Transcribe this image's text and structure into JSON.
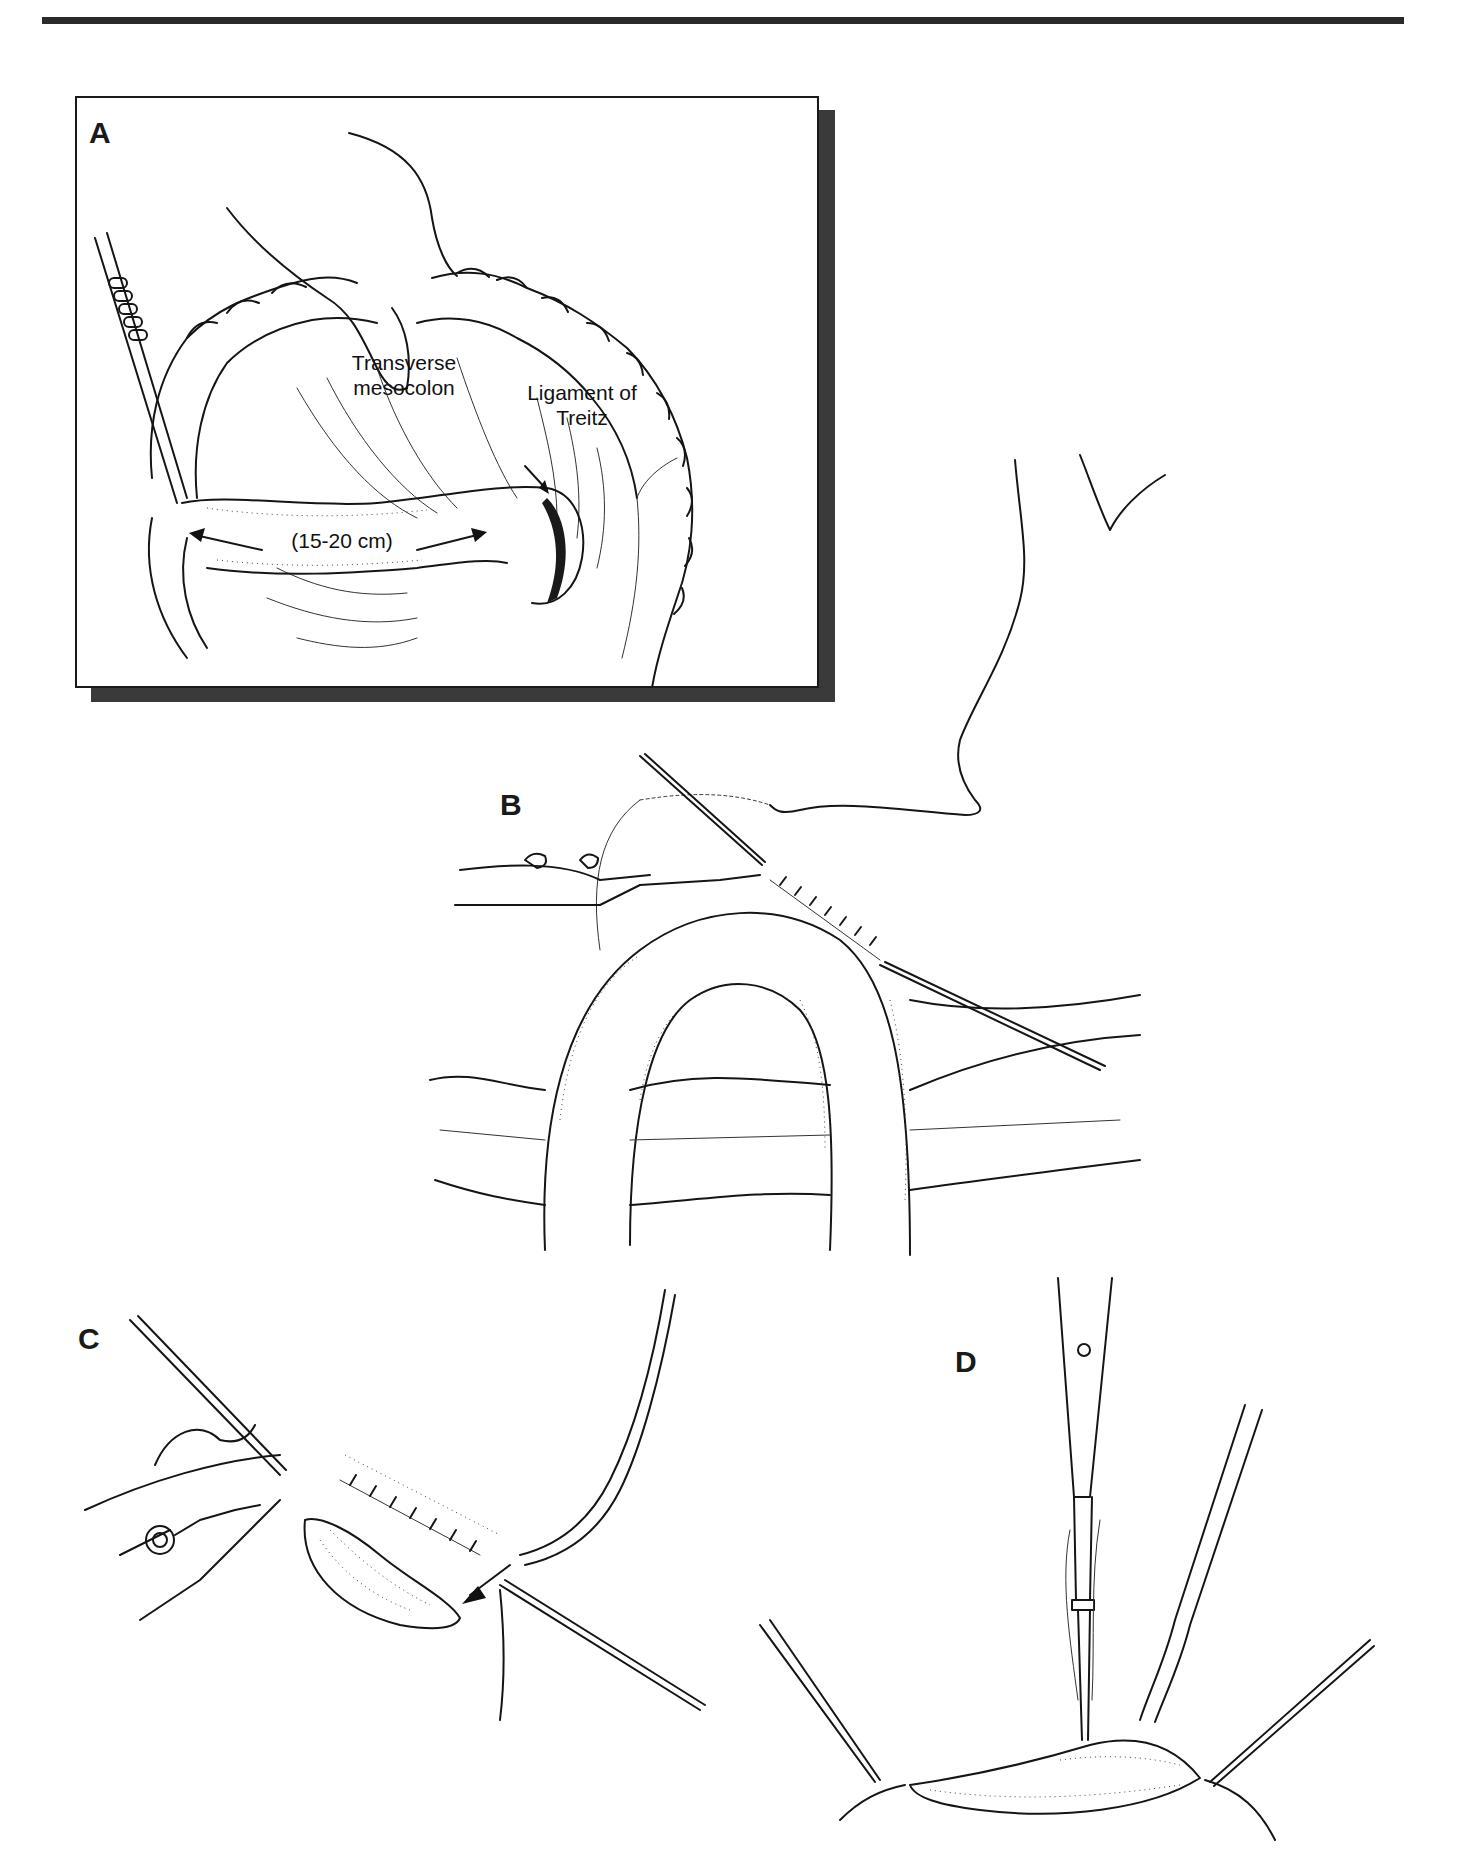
{
  "figure": {
    "panels": [
      {
        "id": "A",
        "letter": "A"
      },
      {
        "id": "B",
        "letter": "B"
      },
      {
        "id": "C",
        "letter": "C"
      },
      {
        "id": "D",
        "letter": "D"
      }
    ],
    "panel_a_labels": {
      "transverse_mesocolon_line1": "Transverse",
      "transverse_mesocolon_line2": "mesocolon",
      "ligament_line1": "Ligament of",
      "ligament_line2": "Treitz",
      "measurement": "(15-20 cm)"
    }
  }
}
